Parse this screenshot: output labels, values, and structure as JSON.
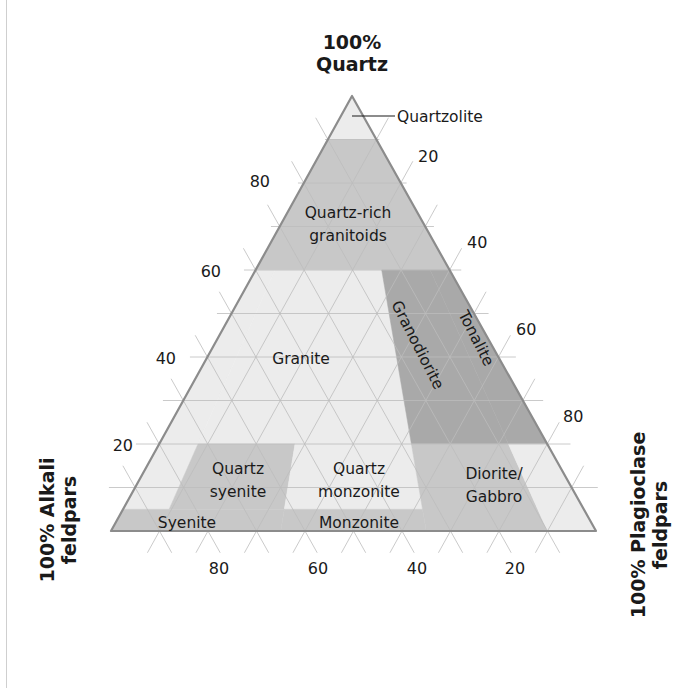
{
  "diagram": {
    "type": "ternary-qapf",
    "geometry": {
      "apex": [
        352,
        96
      ],
      "left": [
        111,
        531
      ],
      "right": [
        596,
        531
      ]
    },
    "colors": {
      "light": "#ececec",
      "mid": "#c8c8c8",
      "dark": "#a9a9a9",
      "edge": "#8c8c8c",
      "grid": "#bdbdbd",
      "grid_faint": "#d8d8d8",
      "text": "#1a1a1a"
    },
    "corners": {
      "top": {
        "line1": "100%",
        "line2": "Quartz"
      },
      "left": {
        "line1": "100% Alkali",
        "line2": "feldpars"
      },
      "right": {
        "line1": "100% Plagioclase",
        "line2": "feldpars"
      }
    },
    "ticks": {
      "left_axis": [
        "20",
        "40",
        "60",
        "80"
      ],
      "right_axis": [
        "20",
        "40",
        "60",
        "80"
      ],
      "bottom_axis": [
        "80",
        "60",
        "40",
        "20"
      ]
    },
    "regions": [
      {
        "id": "quartzolite",
        "label": "Quartzolite",
        "shade": "light",
        "q": [
          0.9,
          1.0
        ],
        "p": [
          0,
          1
        ]
      },
      {
        "id": "quartz-rich-granitoids",
        "label": "Quartz-rich granitoids",
        "label_lines": [
          "Quartz-rich",
          "granitoids"
        ],
        "shade": "mid",
        "q": [
          0.6,
          0.9
        ],
        "p": [
          0,
          1
        ]
      },
      {
        "id": "alkali-granite",
        "label": "",
        "shade": "light",
        "q": [
          0.2,
          0.6
        ],
        "p": [
          0,
          0.1
        ]
      },
      {
        "id": "granite",
        "label": "Granite",
        "shade": "light",
        "q": [
          0.2,
          0.6
        ],
        "p": [
          0.1,
          0.65
        ]
      },
      {
        "id": "granodiorite",
        "label": "Granodiorite",
        "shade": "dark",
        "q": [
          0.2,
          0.6
        ],
        "p": [
          0.65,
          0.9
        ]
      },
      {
        "id": "tonalite",
        "label": "Tonalite",
        "shade": "dark",
        "q": [
          0.2,
          0.6
        ],
        "p": [
          0.9,
          1.0
        ]
      },
      {
        "id": "alkali-quartz-syenite",
        "label": "",
        "shade": "light",
        "q": [
          0.05,
          0.2
        ],
        "p": [
          0,
          0.1
        ]
      },
      {
        "id": "quartz-syenite",
        "label": "Quartz syenite",
        "label_lines": [
          "Quartz",
          "syenite"
        ],
        "shade": "mid",
        "q": [
          0.05,
          0.2
        ],
        "p": [
          0.1,
          0.35
        ]
      },
      {
        "id": "quartz-monzonite",
        "label": "Quartz monzonite",
        "label_lines": [
          "Quartz",
          "monzonite"
        ],
        "shade": "light",
        "q": [
          0.05,
          0.2
        ],
        "p": [
          0.35,
          0.65
        ]
      },
      {
        "id": "diorite-gabbro",
        "label": "Diorite/ Gabbro",
        "label_lines": [
          "Diorite/",
          "Gabbro"
        ],
        "shade": "mid",
        "q": [
          0.0,
          0.2
        ],
        "p": [
          0.65,
          0.9
        ]
      },
      {
        "id": "anorthosite",
        "label": "",
        "shade": "light",
        "q": [
          0.0,
          0.2
        ],
        "p": [
          0.9,
          1.0
        ]
      },
      {
        "id": "syenite",
        "label": "Syenite",
        "shade": "mid",
        "q": [
          0.0,
          0.05
        ],
        "p": [
          0,
          0.35
        ]
      },
      {
        "id": "monzonite",
        "label": "Monzonite",
        "shade": "mid",
        "q": [
          0.0,
          0.05
        ],
        "p": [
          0.35,
          0.65
        ]
      }
    ],
    "callout": {
      "label": "Quartzolite"
    }
  }
}
